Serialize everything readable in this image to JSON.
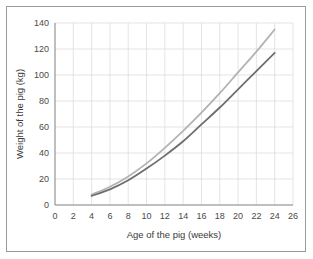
{
  "chart_data": {
    "type": "line",
    "title": "",
    "xlabel": "Age of the pig (weeks)",
    "ylabel": "Weight of the pig (kg)",
    "xlim": [
      0,
      26
    ],
    "ylim": [
      0,
      140
    ],
    "xticks": [
      0,
      2,
      4,
      6,
      8,
      10,
      12,
      14,
      16,
      18,
      20,
      22,
      24,
      26
    ],
    "yticks": [
      0,
      20,
      40,
      60,
      80,
      100,
      120,
      140
    ],
    "grid": true,
    "legend": "none",
    "x": [
      4,
      6,
      8,
      10,
      12,
      14,
      16,
      18,
      20,
      22,
      24
    ],
    "series": [
      {
        "name": "upper-growth-curve",
        "color": "#b3b3b3",
        "values": [
          8,
          14,
          22,
          32,
          44,
          57,
          71,
          86,
          102,
          118,
          135
        ]
      },
      {
        "name": "lower-growth-curve",
        "color": "#6e6e6e",
        "values": [
          7,
          12,
          19,
          28,
          38,
          49,
          62,
          75,
          89,
          103,
          117
        ]
      }
    ]
  },
  "axes": {
    "x_tick_labels": [
      "0",
      "2",
      "4",
      "6",
      "8",
      "10",
      "12",
      "14",
      "16",
      "18",
      "20",
      "22",
      "24",
      "26"
    ],
    "y_tick_labels": [
      "0",
      "20",
      "40",
      "60",
      "80",
      "100",
      "120",
      "140"
    ]
  }
}
